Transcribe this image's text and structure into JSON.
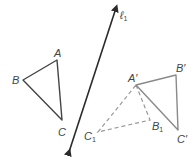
{
  "diagram": {
    "type": "geometric-reflection",
    "colors": {
      "line": "#2b2b2b",
      "original_triangle": "#444444",
      "image_triangle": "#8a8a8a",
      "dashed_triangle": "#9a9a9a",
      "label": "#444444"
    },
    "line_of_reflection": {
      "label": "ℓ",
      "subscript": "1",
      "start": [
        69,
        152
      ],
      "end": [
        116,
        8
      ]
    },
    "triangle_original": {
      "vertices": {
        "A": {
          "label": "A",
          "point": [
            57,
            60
          ]
        },
        "B": {
          "label": "B",
          "point": [
            23,
            80
          ]
        },
        "C": {
          "label": "C",
          "point": [
            62,
            120
          ]
        }
      }
    },
    "triangle_image": {
      "vertices": {
        "A_prime": {
          "label": "A′",
          "point": [
            136,
            85
          ]
        },
        "B_prime": {
          "label": "B′",
          "point": [
            176,
            75
          ]
        },
        "C_prime": {
          "label": "C′",
          "point": [
            178,
            130
          ]
        }
      }
    },
    "triangle_intermediate": {
      "style": "dashed",
      "vertices": {
        "A_prime": {
          "label": "A′",
          "point": [
            136,
            85
          ]
        },
        "B1": {
          "label": "B",
          "subscript": "1",
          "point": [
            150,
            120
          ]
        },
        "C1": {
          "label": "C",
          "subscript": "1",
          "point": [
            98,
            132
          ]
        }
      }
    }
  }
}
